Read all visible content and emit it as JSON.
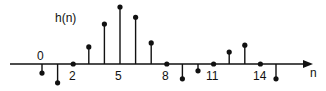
{
  "chart_data": {
    "type": "stem",
    "title": "h(n)",
    "xlabel": "n",
    "ylabel": "h(n)",
    "x": [
      0,
      1,
      2,
      3,
      4,
      5,
      6,
      7,
      8,
      9,
      10,
      11,
      12,
      13,
      14,
      15
    ],
    "values": [
      -0.16,
      -0.33,
      0,
      0.3,
      0.7,
      1.0,
      0.82,
      0.37,
      0,
      -0.26,
      -0.12,
      0,
      0.21,
      0.33,
      0,
      -0.26
    ],
    "tick_labels": [
      "0",
      "2",
      "5",
      "8",
      "11",
      "14"
    ],
    "tick_positions": [
      0,
      2,
      5,
      8,
      11,
      14
    ],
    "grid": false,
    "legend": null
  },
  "labels": {
    "title": "h(n)",
    "axis_n": "n",
    "ticks": [
      "0",
      "2",
      "5",
      "8",
      "11",
      "14"
    ]
  }
}
